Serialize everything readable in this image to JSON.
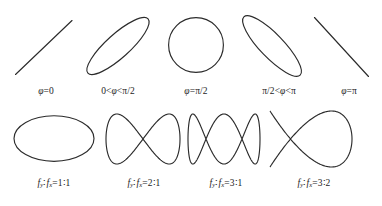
{
  "figure": {
    "title_hidden": "Lissajous figures",
    "stroke_color": "#2b2b2b",
    "background_color": "#ffffff",
    "rows": [
      {
        "name": "phase-difference-row",
        "description": "Lissajous curves for equal frequencies at varying phase difference",
        "panels": [
          {
            "name": "phase-0",
            "shape": "line-rising",
            "caption_html": "<i>φ</i>=0",
            "caption_plain": "φ=0"
          },
          {
            "name": "phase-between-0-and-half-pi",
            "shape": "narrow-ellipse-rising",
            "caption_html": "0&lt;<i>φ</i>&lt;π/2",
            "caption_plain": "0<φ<π/2"
          },
          {
            "name": "phase-half-pi",
            "shape": "circle",
            "caption_html": "<i>φ</i>=π/2",
            "caption_plain": "φ=π/2"
          },
          {
            "name": "phase-between-half-pi-and-pi",
            "shape": "narrow-ellipse-falling",
            "caption_html": "π/2&lt;<i>φ</i>&lt;π",
            "caption_plain": "π/2<φ<π"
          },
          {
            "name": "phase-pi",
            "shape": "line-falling",
            "caption_html": "<i>φ</i>=π",
            "caption_plain": "φ=π"
          }
        ]
      },
      {
        "name": "frequency-ratio-row",
        "description": "Lissajous curves for varying frequency ratio f_y : f_x",
        "panels": [
          {
            "name": "ratio-1-1",
            "shape": "wide-ellipse",
            "caption_html": "<i>f</i><span class=\"sub\">y</span>∶<i>f</i><span class=\"sub\">x</span>=1∶1",
            "caption_plain": "f_y : f_x = 1 : 1",
            "ratio": "1:1"
          },
          {
            "name": "ratio-2-1",
            "shape": "lissajous-2-1",
            "caption_html": "<i>f</i><span class=\"sub\">y</span>∶<i>f</i><span class=\"sub\">x</span>=2∶1",
            "caption_plain": "f_y : f_x = 2 : 1",
            "ratio": "2:1"
          },
          {
            "name": "ratio-3-1",
            "shape": "lissajous-3-1",
            "caption_html": "<i>f</i><span class=\"sub\">y</span>∶<i>f</i><span class=\"sub\">x</span>=3∶1",
            "caption_plain": "f_y : f_x = 3 : 1",
            "ratio": "3:1"
          },
          {
            "name": "ratio-3-2",
            "shape": "lissajous-3-2",
            "caption_html": "<i>f</i><span class=\"sub\">y</span>∶<i>f</i><span class=\"sub\">x</span>=3∶2",
            "caption_plain": "f_y : f_x = 3 : 2",
            "ratio": "3:2"
          }
        ]
      }
    ]
  },
  "chart_data": {
    "type": "scatter",
    "title": "",
    "xlabel": "",
    "ylabel": "",
    "series": [
      {
        "name": "φ=0",
        "curve": "straight line of slope +1",
        "phase_deg": 0,
        "freq_ratio": "1:1"
      },
      {
        "name": "0<φ<π/2",
        "curve": "narrow ellipse tilted +45°",
        "phase_deg": 30,
        "freq_ratio": "1:1"
      },
      {
        "name": "φ=π/2",
        "curve": "circle",
        "phase_deg": 90,
        "freq_ratio": "1:1"
      },
      {
        "name": "π/2<φ<π",
        "curve": "narrow ellipse tilted -45°",
        "phase_deg": 150,
        "freq_ratio": "1:1"
      },
      {
        "name": "φ=π",
        "curve": "straight line of slope -1",
        "phase_deg": 180,
        "freq_ratio": "1:1"
      },
      {
        "name": "f_y:f_x=1:1",
        "curve": "wide ellipse",
        "freq_ratio": "1:1"
      },
      {
        "name": "f_y:f_x=2:1",
        "curve": "figure-eight (two lobes)",
        "freq_ratio": "2:1"
      },
      {
        "name": "f_y:f_x=3:1",
        "curve": "three vertical loops",
        "freq_ratio": "3:1"
      },
      {
        "name": "f_y:f_x=3:2",
        "curve": "interlaced 3:2 Lissajous knot",
        "freq_ratio": "3:2"
      }
    ]
  }
}
